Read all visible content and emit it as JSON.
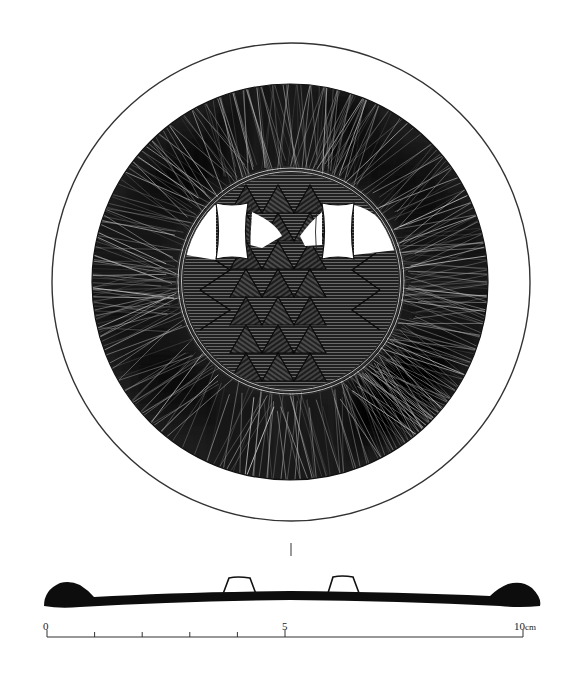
{
  "figure": {
    "type": "archaeological artifact drawing",
    "views": [
      "plan view (top)",
      "cross-section profile"
    ],
    "colors": {
      "background": "#ffffff",
      "ink": "#111111",
      "hatch_light": "#9a9a9a",
      "rim_line": "#333333"
    }
  },
  "plan_view": {
    "outer_rim": {
      "cx": 291,
      "cy": 282,
      "r": 239
    },
    "decorated_band": {
      "cx": 290,
      "cy": 282,
      "r": 198
    },
    "inner_ring": {
      "cx": 291,
      "cy": 281,
      "r": 112,
      "concentric_lines": 4
    },
    "white_panels": [
      {
        "label": "left panel",
        "x": 216,
        "y": 203,
        "w": 32,
        "h": 56
      },
      {
        "label": "right panel",
        "x": 322,
        "y": 203,
        "w": 32,
        "h": 56
      }
    ],
    "center_motif": "stacked triangle / zigzag lattice"
  },
  "section_view": {
    "center_marker": "|",
    "lugs": 2
  },
  "scale_bar": {
    "labels": [
      "0",
      "5",
      "10"
    ],
    "unit": "cm",
    "x_start": 47,
    "x_end": 523,
    "ticks": 10
  }
}
